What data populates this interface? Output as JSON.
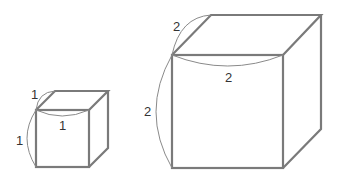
{
  "diagram": {
    "type": "two cubes with edge length labels",
    "small_cube": {
      "edge_length": 1,
      "labels": {
        "depth": "1",
        "width": "1",
        "height": "1"
      }
    },
    "large_cube": {
      "edge_length": 2,
      "labels": {
        "depth": "2",
        "width": "2",
        "height": "2"
      }
    },
    "colors": {
      "edge": "#7a7a7a",
      "arc": "#8a8a8a",
      "text": "#333333"
    }
  }
}
